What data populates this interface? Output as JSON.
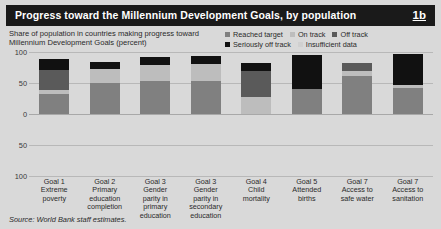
{
  "header": {
    "title": "Progress toward the Millennium Development Goals, by population",
    "figure_number": "1b"
  },
  "subtitle": "Share of population in countries making progress toward\nMillennium Development Goals (percent)",
  "source": "Source: World Bank staff estimates.",
  "colors": {
    "titlebar_bg": "#1a1a1a",
    "panel_bg": "#d9d9d9",
    "reached_target": "#808080",
    "on_track": "#bdbdbd",
    "off_track": "#5a5a5a",
    "seriously_off_track": "#111111",
    "insufficient_data": "#d0d0d0",
    "gridline": "#b8b8b8"
  },
  "chart_data": {
    "type": "bar",
    "title": "Progress toward the Millennium Development Goals, by population",
    "subtitle": "Share of population in countries making progress toward Millennium Development Goals (percent)",
    "xlabel": "",
    "ylabel": "percent",
    "ylim": [
      -100,
      100
    ],
    "yticks": [
      100,
      50,
      0,
      50,
      100
    ],
    "ytick_labels": [
      "100",
      "50",
      "0",
      "50",
      "100"
    ],
    "grid": true,
    "stacked": true,
    "legend_position": "top-right",
    "categories": [
      "Goal 1\nExtreme\npoverty",
      "Goal 2\nPrimary\neducation\ncompletion",
      "Goal 3\nGender\nparity in\nprimary\neducation",
      "Goal 3\nGender\nparity in\nsecondary\neducation",
      "Goal 4\nChild\nmortality",
      "Goal 5\nAttended\nbirths",
      "Goal 7\nAccess to\nsafe water",
      "Goal 7\nAccess to\nsanitation"
    ],
    "series": [
      {
        "name": "Reached target",
        "color": "#808080",
        "values": [
          33,
          50,
          53,
          53,
          0,
          40,
          62,
          42
        ]
      },
      {
        "name": "On track",
        "color": "#bdbdbd",
        "values": [
          5,
          22,
          26,
          27,
          28,
          0,
          8,
          5
        ]
      },
      {
        "name": "Off track",
        "color": "#5a5a5a",
        "values": [
          33,
          0,
          0,
          0,
          42,
          0,
          12,
          0
        ]
      },
      {
        "name": "Seriously off track",
        "color": "#111111",
        "values": [
          17,
          12,
          13,
          13,
          12,
          55,
          0,
          50
        ]
      },
      {
        "name": "Insufficient data",
        "color": "#d0d0d0",
        "values": [
          0,
          0,
          0,
          0,
          0,
          0,
          0,
          0
        ]
      }
    ],
    "legend": [
      {
        "label": "Reached target",
        "color": "#808080"
      },
      {
        "label": "On track",
        "color": "#bdbdbd"
      },
      {
        "label": "Off track",
        "color": "#5a5a5a"
      },
      {
        "label": "Seriously off track",
        "color": "#111111"
      },
      {
        "label": "Insufficient data",
        "color": "#d0d0d0"
      }
    ]
  }
}
